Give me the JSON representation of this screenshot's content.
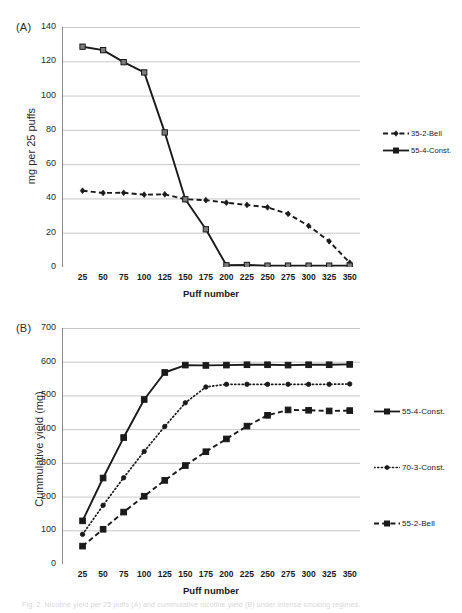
{
  "figure": {
    "panel_a_letter": "(A)",
    "panel_b_letter": "(B)",
    "caption": "Fig. 2. Nicotine yield per 25 puffs (A) and cummulative nicotine yield (B) under intense smoking regimes."
  },
  "chart_data": [
    {
      "id": "panel_a",
      "type": "line",
      "title": "(A)",
      "xlabel": "Puff number",
      "ylabel": "mg per 25 puffs",
      "xlim": [
        0,
        362.5
      ],
      "ylim": [
        0,
        140
      ],
      "yticks": [
        0,
        20,
        40,
        60,
        80,
        100,
        120,
        140
      ],
      "x": [
        25,
        50,
        75,
        100,
        125,
        150,
        175,
        200,
        225,
        250,
        275,
        300,
        325,
        350
      ],
      "xticks": [
        25,
        50,
        75,
        100,
        125,
        150,
        175,
        200,
        225,
        250,
        275,
        300,
        325,
        350
      ],
      "grid": "horizontal",
      "legend_position": "right",
      "series": [
        {
          "name": "35-2-Bell",
          "marker": "diamond",
          "line": "dashed",
          "color": "#1a1a1a",
          "values": [
            44.5,
            43.2,
            43.3,
            42.2,
            42.4,
            39.5,
            39.0,
            37.5,
            36.2,
            34.8,
            31.0,
            24.0,
            15.0,
            2.5
          ]
        },
        {
          "name": "55-4-Const.",
          "marker": "square",
          "line": "solid",
          "color": "#1a1a1a",
          "values": [
            128.5,
            126.5,
            119.5,
            113.5,
            78.5,
            39.5,
            22.0,
            1.0,
            1.2,
            0.8,
            0.8,
            0.8,
            0.8,
            0.8
          ]
        }
      ]
    },
    {
      "id": "panel_b",
      "type": "line",
      "title": "(B)",
      "xlabel": "Puff number",
      "ylabel": "Cummulative yield (mg)",
      "xlim": [
        0,
        362.5
      ],
      "ylim": [
        0,
        700
      ],
      "yticks": [
        0,
        100,
        200,
        300,
        400,
        500,
        600,
        700
      ],
      "x": [
        25,
        50,
        75,
        100,
        125,
        150,
        175,
        200,
        225,
        250,
        275,
        300,
        325,
        350
      ],
      "xticks": [
        25,
        50,
        75,
        100,
        125,
        150,
        175,
        200,
        225,
        250,
        275,
        300,
        325,
        350
      ],
      "grid": "horizontal",
      "legend_position": "right",
      "series": [
        {
          "name": "55-4-Const.",
          "marker": "square",
          "line": "solid",
          "color": "#1a1a1a",
          "values": [
            128,
            255,
            375,
            488,
            568,
            590,
            589,
            590,
            591,
            591,
            590,
            591,
            591,
            592
          ]
        },
        {
          "name": "70-3-Const.",
          "marker": "circle",
          "line": "dotted",
          "color": "#1a1a1a",
          "values": [
            88,
            174,
            256,
            334,
            408,
            478,
            525,
            533,
            533,
            533,
            533,
            533,
            533,
            534
          ]
        },
        {
          "name": "55-2-Bell",
          "marker": "square",
          "line": "dashed",
          "color": "#1a1a1a",
          "values": [
            53,
            103,
            154,
            201,
            248,
            292,
            333,
            371,
            409,
            441,
            457,
            456,
            454,
            455
          ]
        }
      ]
    }
  ],
  "panel_a": {
    "letter": "(A)",
    "ylabel": "mg per 25 puffs",
    "xlabel": "Puff number",
    "yticks": [
      "140",
      "120",
      "100",
      "80",
      "60",
      "40",
      "20",
      "0"
    ],
    "xticks": [
      "25",
      "50",
      "75",
      "100",
      "125",
      "150",
      "175",
      "200",
      "225",
      "250",
      "275",
      "300",
      "325",
      "350"
    ],
    "legend": [
      {
        "label": "35-2-Bell",
        "marker": "diamond",
        "line": "dashed"
      },
      {
        "label": "55-4-Const.",
        "marker": "square",
        "line": "solid"
      }
    ]
  },
  "panel_b": {
    "letter": "(B)",
    "ylabel": "Cummulative yield (mg)",
    "xlabel": "Puff number",
    "yticks": [
      "700",
      "600",
      "500",
      "400",
      "300",
      "200",
      "100",
      "0"
    ],
    "xticks": [
      "25",
      "50",
      "75",
      "100",
      "125",
      "150",
      "175",
      "200",
      "225",
      "250",
      "275",
      "300",
      "325",
      "350"
    ],
    "legend": [
      {
        "label": "55-4-Const.",
        "marker": "square",
        "line": "solid"
      },
      {
        "label": "70-3-Const.",
        "marker": "circle",
        "line": "dotted"
      },
      {
        "label": "55-2-Bell",
        "marker": "square",
        "line": "dashed"
      }
    ]
  },
  "colors": {
    "ink": "#1a1a1a",
    "grid": "#b9b9b9",
    "axis": "#8c8c8c",
    "text": "#2b2b2b"
  }
}
